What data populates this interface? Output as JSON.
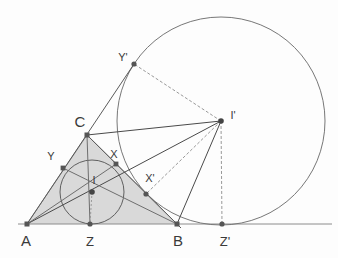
{
  "figure": {
    "background_color": "#fdfdfd",
    "stroke_color": "#4a4a4a",
    "thin_stroke_color": "#8c8c8c",
    "triangle_fill": "#d9d9d9",
    "point_color": "#555555",
    "label_color": "#3a3a3a"
  },
  "labels": {
    "A": "A",
    "B": "B",
    "C": "C",
    "Z": "Z",
    "Zp": "Z'",
    "I": "I",
    "Ip": "I'",
    "X": "X",
    "Xp": "X'",
    "Y": "Y",
    "Yp": "Y'"
  },
  "geometry": {
    "points": {
      "A": {
        "x": 27,
        "y": 224
      },
      "B": {
        "x": 177,
        "y": 224
      },
      "C": {
        "x": 87,
        "y": 135
      },
      "Z": {
        "x": 90,
        "y": 224
      },
      "Zp": {
        "x": 222,
        "y": 224
      },
      "I": {
        "x": 92,
        "y": 192
      },
      "Ip": {
        "x": 221,
        "y": 121
      },
      "X": {
        "x": 116,
        "y": 164
      },
      "Xp": {
        "x": 146,
        "y": 194
      },
      "Y": {
        "x": 63,
        "y": 168
      },
      "Yp": {
        "x": 134,
        "y": 64
      }
    },
    "circles": {
      "incircle": {
        "cx": 92,
        "cy": 192,
        "r": 32
      },
      "excircle": {
        "cx": 221,
        "cy": 121,
        "r": 104
      }
    },
    "label_positions": {
      "A": {
        "x": 26,
        "y": 246
      },
      "B": {
        "x": 178,
        "y": 246
      },
      "C": {
        "x": 80,
        "y": 127
      },
      "Z": {
        "x": 90,
        "y": 246
      },
      "Zp": {
        "x": 225,
        "y": 246
      },
      "I": {
        "x": 94,
        "y": 183
      },
      "Ip": {
        "x": 232,
        "y": 118
      },
      "X": {
        "x": 114,
        "y": 157
      },
      "Xp": {
        "x": 149,
        "y": 181
      },
      "Y": {
        "x": 51,
        "y": 159
      },
      "Yp": {
        "x": 122,
        "y": 60
      }
    }
  },
  "elements": {
    "baseline_label": "baseline A-B-Z'",
    "shaded_region_label": "triangle ABC shaded"
  }
}
